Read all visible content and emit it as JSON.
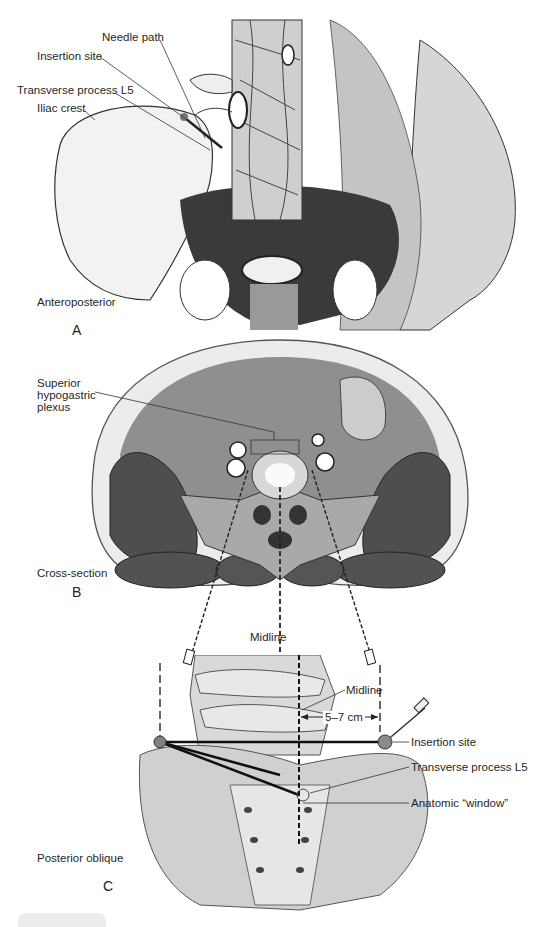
{
  "figure": {
    "panels": [
      {
        "id": "A",
        "letter": "A",
        "view": "Anteroposterior",
        "labels": {
          "needle_path": "Needle path",
          "insertion_site": "Insertion site",
          "transverse_process": "Transverse process L5",
          "iliac_crest": "Iliac crest"
        }
      },
      {
        "id": "B",
        "letter": "B",
        "view": "Cross-section",
        "labels": {
          "plexus": "Superior hypogastric plexus",
          "plexus_line1": "Superior",
          "plexus_line2": "hypogastric",
          "plexus_line3": "plexus",
          "midline": "Midline"
        }
      },
      {
        "id": "C",
        "letter": "C",
        "view": "Posterior oblique",
        "labels": {
          "midline": "Midline",
          "distance": "5–7 cm",
          "insertion_site": "Insertion site",
          "transverse_process": "Transverse process L5",
          "anatomic_window": "Anatomic “window”"
        }
      }
    ],
    "colors": {
      "ink": "#1a1a1a",
      "muscle": "#5a5a5a",
      "muscle_dark": "#3e3e3e",
      "bone": "#a9a9a9",
      "fat": "#ececec",
      "cavity": "#8a8a8a",
      "background": "#ffffff"
    }
  }
}
